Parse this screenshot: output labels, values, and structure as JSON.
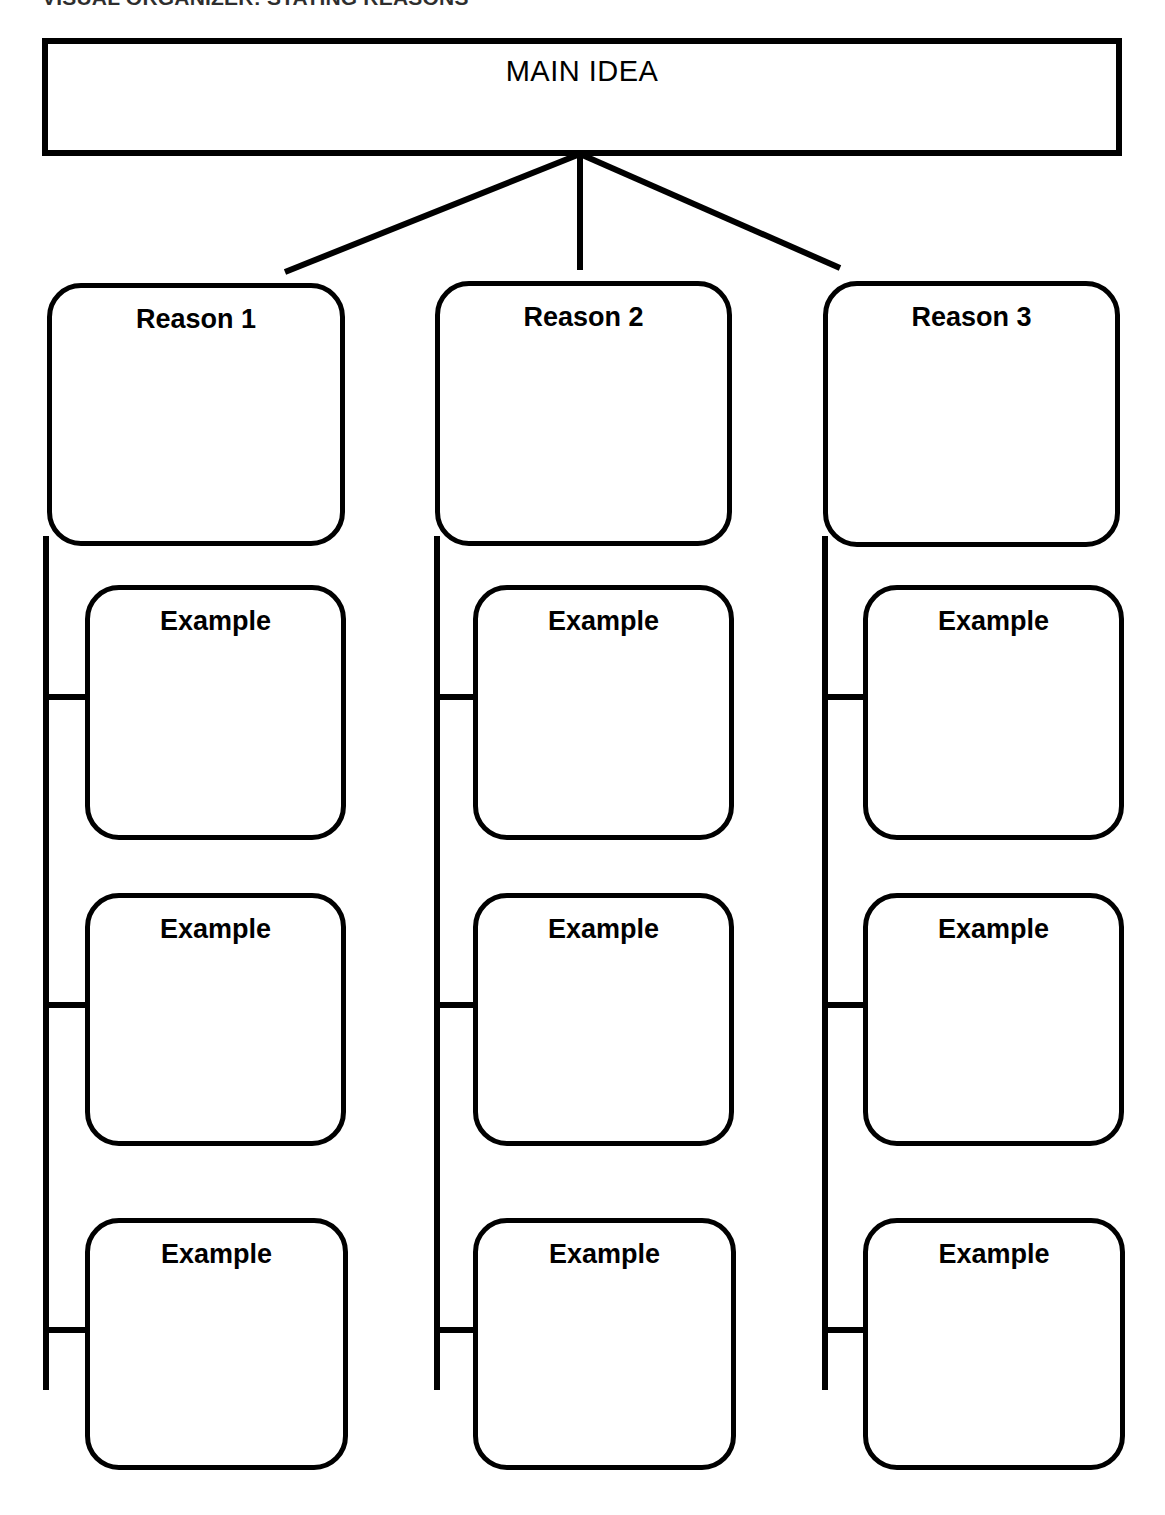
{
  "page": {
    "header": "VISUAL ORGANIZER: STATING REASONS",
    "width": 1165,
    "height": 1515,
    "background": "#ffffff",
    "stroke_color": "#000000"
  },
  "diagram": {
    "type": "hierarchy-tree",
    "main": {
      "label": "MAIN IDEA",
      "shape": "rectangle",
      "x": 42,
      "y": 38,
      "w": 1080,
      "h": 118
    },
    "branch_origin": {
      "x": 580,
      "y": 154
    },
    "columns": [
      {
        "reason": {
          "label": "Reason 1",
          "shape": "rounded-rectangle",
          "x": 47,
          "y": 283,
          "w": 298,
          "h": 263
        },
        "spine": {
          "x": 46,
          "y1": 536,
          "y2": 1390
        },
        "examples": [
          {
            "label": "Example",
            "x": 85,
            "y": 585,
            "w": 261,
            "h": 255,
            "stub_y": 697
          },
          {
            "label": "Example",
            "x": 85,
            "y": 893,
            "w": 261,
            "h": 253,
            "stub_y": 1005
          },
          {
            "label": "Example",
            "x": 85,
            "y": 1218,
            "w": 263,
            "h": 252,
            "stub_y": 1330
          }
        ]
      },
      {
        "reason": {
          "label": "Reason 2",
          "shape": "rounded-rectangle",
          "x": 435,
          "y": 281,
          "w": 297,
          "h": 265
        },
        "spine": {
          "x": 437,
          "y1": 536,
          "y2": 1390
        },
        "examples": [
          {
            "label": "Example",
            "x": 473,
            "y": 585,
            "w": 261,
            "h": 255,
            "stub_y": 697
          },
          {
            "label": "Example",
            "x": 473,
            "y": 893,
            "w": 261,
            "h": 253,
            "stub_y": 1005
          },
          {
            "label": "Example",
            "x": 473,
            "y": 1218,
            "w": 263,
            "h": 252,
            "stub_y": 1330
          }
        ]
      },
      {
        "reason": {
          "label": "Reason 3",
          "shape": "rounded-rectangle",
          "x": 823,
          "y": 281,
          "w": 297,
          "h": 266
        },
        "spine": {
          "x": 825,
          "y1": 536,
          "y2": 1390
        },
        "examples": [
          {
            "label": "Example",
            "x": 863,
            "y": 585,
            "w": 261,
            "h": 255,
            "stub_y": 697
          },
          {
            "label": "Example",
            "x": 863,
            "y": 893,
            "w": 261,
            "h": 253,
            "stub_y": 1005
          },
          {
            "label": "Example",
            "x": 863,
            "y": 1218,
            "w": 262,
            "h": 252,
            "stub_y": 1330
          }
        ]
      }
    ],
    "branch_lines": [
      {
        "from_x": 580,
        "from_y": 154,
        "to_x": 285,
        "to_y": 272
      },
      {
        "from_x": 580,
        "from_y": 154,
        "to_x": 580,
        "to_y": 270
      },
      {
        "from_x": 580,
        "from_y": 154,
        "to_x": 840,
        "to_y": 268
      }
    ]
  }
}
